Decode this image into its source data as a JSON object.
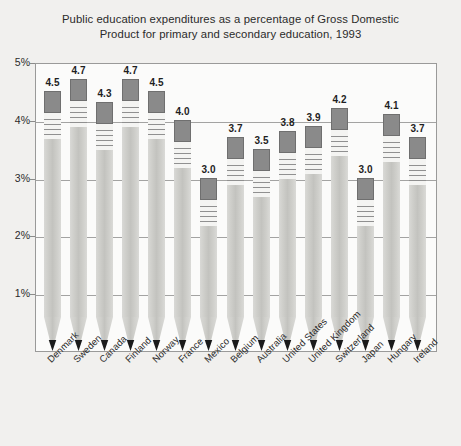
{
  "chart_data": {
    "type": "bar",
    "title": "Public education expenditures as a percentage of Gross Domestic Product for primary and secondary education, 1993",
    "title_lines": [
      "Public education expenditures as a percentage of Gross Domestic",
      "Product for primary and secondary education, 1993"
    ],
    "xlabel": "",
    "ylabel": "",
    "ylim": [
      0,
      5
    ],
    "ytick_values": [
      1,
      2,
      3,
      4,
      5
    ],
    "ytick_labels": [
      "1%",
      "2%",
      "3%",
      "4%",
      "5%"
    ],
    "grid": true,
    "legend": "none",
    "categories": [
      "Denmark",
      "Sweden",
      "Canada",
      "Finland",
      "Norway",
      "France",
      "Mexico",
      "Belgium",
      "Australia",
      "United States",
      "United Kingdom",
      "Switzerland",
      "Japan",
      "Hungary",
      "Ireland"
    ],
    "values": [
      4.5,
      4.7,
      4.3,
      4.7,
      4.5,
      4.0,
      3.0,
      3.7,
      3.5,
      3.8,
      3.9,
      4.2,
      3.0,
      4.1,
      3.7
    ],
    "value_labels": [
      "4.5",
      "4.7",
      "4.3",
      "4.7",
      "4.5",
      "4.0",
      "3.0",
      "3.7",
      "3.5",
      "3.8",
      "3.9",
      "4.2",
      "3.0",
      "4.1",
      "3.7"
    ]
  },
  "colors": {
    "background": "#f1f0ee",
    "plot_background": "#fbfbfa",
    "frame": "#9a9a99",
    "gridline": "#a3a3a2",
    "eraser": "#8a8a8a",
    "pencil_body": "#cfcfcb",
    "pencil_lead": "#1b1b1b",
    "text": "#2b2b2b"
  }
}
